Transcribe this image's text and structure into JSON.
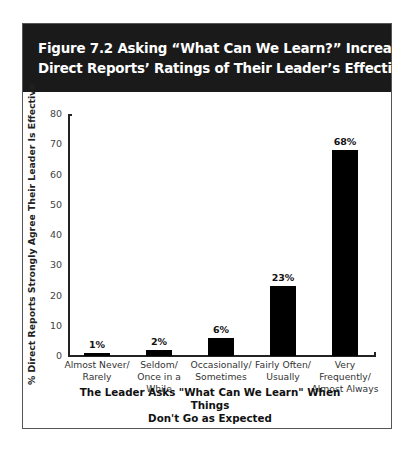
{
  "figure": {
    "title_line1": "Figure 7.2  Asking “What Can We Learn?” Increases",
    "title_line2": "Direct Reports’ Ratings of Their Leader’s Effectiveness"
  },
  "chart_data": {
    "type": "bar",
    "title": "Figure 7.2 Asking “What Can We Learn?” Increases Direct Reports’ Ratings of Their Leader’s Effectiveness",
    "categories": [
      "Almost Never/ Rarely",
      "Seldom/ Once in a While",
      "Occasionally/ Sometimes",
      "Fairly Often/ Usually",
      "Very Frequently/ Almost Always"
    ],
    "category_lines": [
      [
        "Almost Never/",
        "Rarely"
      ],
      [
        "Seldom/",
        "Once in a While"
      ],
      [
        "Occasionally/",
        "Sometimes"
      ],
      [
        "Fairly Often/",
        "Usually"
      ],
      [
        "Very Frequently/",
        "Almost Always"
      ]
    ],
    "values": [
      1,
      2,
      6,
      23,
      68
    ],
    "data_labels": [
      "1%",
      "2%",
      "6%",
      "23%",
      "68%"
    ],
    "xlabel_line1": "The Leader Asks \"What Can We Learn\" When Things",
    "xlabel_line2": "Don't Go as Expected",
    "xlabel": "The Leader Asks \"What Can We Learn\" When Things Don't Go as Expected",
    "ylabel": "% Direct Reports Strongly Agree Their Leader Is Effective",
    "ylim": [
      0,
      80
    ],
    "yticks": [
      "0",
      "10",
      "20",
      "30",
      "40",
      "50",
      "60",
      "70",
      "80"
    ],
    "grid": false,
    "legend": null,
    "bar_color": "#000000",
    "header_color": "#1a1a1a"
  }
}
